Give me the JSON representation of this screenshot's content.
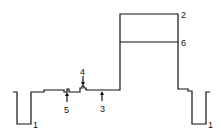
{
  "diagram": {
    "type": "cross-section profile",
    "stroke_color": "#111111",
    "background": "#ffffff",
    "labels": {
      "l1_left": "1",
      "l1_right": "1",
      "l2": "2",
      "l3": "3",
      "l4": "4",
      "l5": "5",
      "l6": "6"
    }
  }
}
